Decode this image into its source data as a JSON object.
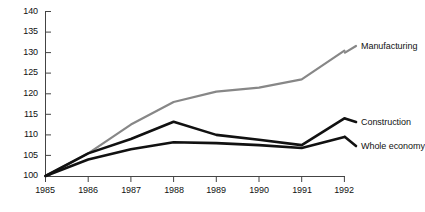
{
  "chart_data": {
    "type": "line",
    "title": "",
    "subtitle": "",
    "xlabel": "",
    "ylabel": "",
    "x": [
      "1985",
      "1986",
      "1987",
      "1988",
      "1989",
      "1990",
      "1991",
      "1992"
    ],
    "xlim": [
      "1985",
      "1992"
    ],
    "ylim": [
      100,
      140
    ],
    "yticks": [
      100,
      105,
      110,
      115,
      120,
      125,
      130,
      135,
      140
    ],
    "xticks": [
      "1985",
      "1986",
      "1987",
      "1988",
      "1989",
      "1990",
      "1991",
      "1992"
    ],
    "grid": false,
    "legend_position": "right-inline-labels",
    "series": [
      {
        "name": "Manufacturing",
        "color": "#878787",
        "values": [
          100,
          105.5,
          112.5,
          118,
          120.5,
          121.5,
          123.5,
          130.5
        ]
      },
      {
        "name": "Construction",
        "color": "#111111",
        "values": [
          100,
          105.5,
          109,
          113.2,
          110,
          108.8,
          107.5,
          114
        ]
      },
      {
        "name": "Whole economy",
        "color": "#111111",
        "values": [
          100,
          104,
          106.5,
          108.2,
          108,
          107.5,
          106.8,
          109.5
        ]
      }
    ]
  },
  "axes": {
    "y_tick_labels": [
      "140",
      "135",
      "130",
      "125",
      "120",
      "115",
      "110",
      "105",
      "100"
    ],
    "x_tick_labels": [
      "1985",
      "1986",
      "1987",
      "1988",
      "1989",
      "1990",
      "1991",
      "1992"
    ]
  },
  "series_labels": [
    {
      "text": "Manufacturing",
      "series": "Manufacturing"
    },
    {
      "text": "Construction",
      "series": "Construction"
    },
    {
      "text": "Whole economy",
      "series": "Whole economy"
    }
  ],
  "colors": {
    "manufacturing": "#878787",
    "construction": "#111111",
    "whole_economy": "#111111",
    "axis": "#444444",
    "text": "#111111",
    "background": "#ffffff"
  }
}
